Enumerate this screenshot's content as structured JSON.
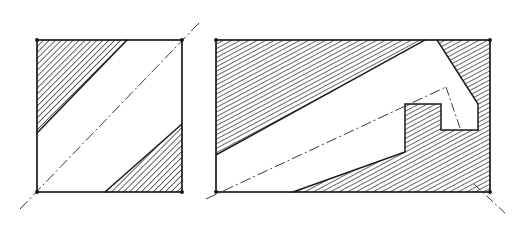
{
  "document": {
    "title": "Hatched section figures",
    "background_color": "#ffffff",
    "ink_color": "#1a1a1a",
    "centerline_color": "#3a3a3a",
    "style": "hand-drawn technical line drawing, ink on paper",
    "figure_count": 2
  },
  "figures": [
    {
      "id": "left-figure",
      "name": "square-with-diagonal-band",
      "shape": "square",
      "outline": {
        "x": 37,
        "y": 40,
        "width": 145,
        "height": 152,
        "corners": [
          [
            37,
            40
          ],
          [
            182,
            40
          ],
          [
            182,
            192
          ],
          [
            37,
            192
          ]
        ]
      },
      "band": {
        "name": "white-diagonal-band",
        "fill": "#ffffff",
        "direction": "lower-left to upper-right",
        "polygon": [
          [
            37,
            133
          ],
          [
            127,
            40
          ],
          [
            182,
            40
          ],
          [
            182,
            124
          ],
          [
            105,
            192
          ],
          [
            37,
            192
          ]
        ]
      },
      "hatched_regions": [
        {
          "name": "upper-left-hatched-triangle",
          "polygon": [
            [
              37,
              40
            ],
            [
              127,
              40
            ],
            [
              37,
              133
            ]
          ],
          "hatch_angle_deg": 45,
          "hatch_spacing_px": 3
        },
        {
          "name": "lower-right-hatched-triangle",
          "polygon": [
            [
              182,
              124
            ],
            [
              182,
              192
            ],
            [
              105,
              192
            ]
          ],
          "hatch_angle_deg": 45,
          "hatch_spacing_px": 3
        }
      ],
      "centerlines": [
        {
          "name": "main-diagonal-centerline",
          "from": [
            20,
            209
          ],
          "to": [
            199,
            23
          ],
          "style": "dash-dot"
        }
      ],
      "corner_dots": [
        [
          37,
          40
        ],
        [
          182,
          40
        ],
        [
          182,
          192
        ],
        [
          37,
          192
        ]
      ]
    },
    {
      "id": "right-figure",
      "name": "rectangle-with-notched-L-band",
      "shape": "rectangle",
      "outline": {
        "x": 216,
        "y": 40,
        "width": 274,
        "height": 152,
        "corners": [
          [
            216,
            40
          ],
          [
            490,
            40
          ],
          [
            490,
            192
          ],
          [
            216,
            192
          ]
        ]
      },
      "band": {
        "name": "white-L-shaped-band",
        "fill": "#ffffff",
        "direction": "lower-left to upper-right with right-angle notch",
        "polygon": [
          [
            216,
            155
          ],
          [
            425,
            40
          ],
          [
            437,
            40
          ],
          [
            478,
            104
          ],
          [
            478,
            130
          ],
          [
            441,
            130
          ],
          [
            441,
            104
          ],
          [
            405,
            104
          ],
          [
            405,
            152
          ],
          [
            293,
            192
          ],
          [
            216,
            192
          ]
        ]
      },
      "hatched_regions": [
        {
          "name": "upper-left-large-hatched-region",
          "polygon": [
            [
              216,
              40
            ],
            [
              425,
              40
            ],
            [
              216,
              155
            ]
          ],
          "hatch_angle_deg": 60,
          "hatch_spacing_px": 3
        },
        {
          "name": "top-right-hatched-corner",
          "polygon": [
            [
              437,
              40
            ],
            [
              490,
              40
            ],
            [
              490,
              192
            ],
            [
              478,
              130
            ],
            [
              478,
              104
            ]
          ],
          "hatch_angle_deg": 60,
          "hatch_spacing_px": 3
        },
        {
          "name": "lower-middle-hatched-region",
          "polygon": [
            [
              293,
              192
            ],
            [
              405,
              152
            ],
            [
              405,
              104
            ],
            [
              441,
              104
            ],
            [
              441,
              130
            ],
            [
              478,
              130
            ],
            [
              490,
              192
            ]
          ],
          "hatch_angle_deg": 60,
          "hatch_spacing_px": 3
        }
      ],
      "centerlines": [
        {
          "name": "band-axis-centerline",
          "from": [
            206,
            199
          ],
          "to": [
            446,
            87
          ],
          "style": "dash-dot"
        },
        {
          "name": "notch-vertical-centerline",
          "from": [
            446,
            87
          ],
          "to": [
            460,
            128
          ],
          "style": "dash-dot"
        },
        {
          "name": "corner-extension-centerline",
          "from": [
            474,
            184
          ],
          "to": [
            507,
            215
          ],
          "style": "dash-dot"
        }
      ],
      "corner_dots": [
        [
          216,
          40
        ],
        [
          490,
          40
        ],
        [
          490,
          192
        ],
        [
          216,
          192
        ]
      ]
    }
  ],
  "legend": {
    "hatch_label": "section hatching",
    "band_label": "unhatched band",
    "centerline_label": "centre line (dash-dot)"
  }
}
